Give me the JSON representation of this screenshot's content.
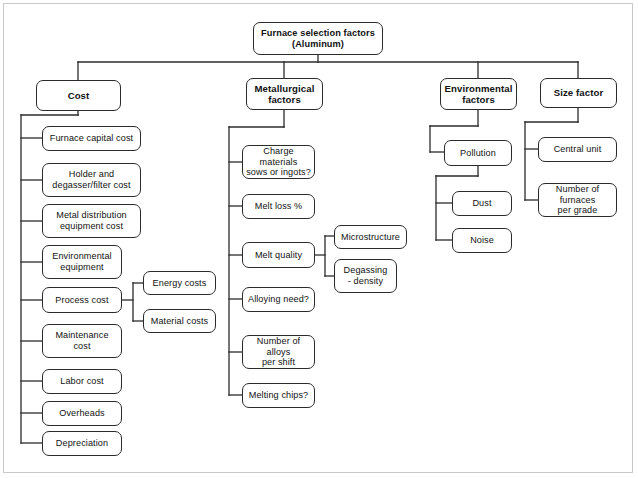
{
  "diagram": {
    "type": "tree-hierarchy",
    "title_node": {
      "id": "root",
      "label": "Furnace selection factors\n(Aluminum)"
    },
    "style": {
      "node_border_color": "#2b2b2b",
      "node_fill_color": "#ffffff",
      "edge_color": "#2b2b2b",
      "text_color": "#111111",
      "background_color": "#ffffff",
      "frame_color": "#c9c9c9"
    },
    "branches": [
      {
        "id": "cost",
        "label": "Cost",
        "children": [
          {
            "id": "furnace-capital-cost",
            "label": "Furnace capital cost"
          },
          {
            "id": "holder-degasser-filter-cost",
            "label": "Holder and\ndegasser/filter cost"
          },
          {
            "id": "metal-distribution-equipment-cost",
            "label": "Metal distribution\nequipment cost"
          },
          {
            "id": "environmental-equipment",
            "label": "Environmental\nequipment"
          },
          {
            "id": "process-cost",
            "label": "Process cost",
            "children": [
              {
                "id": "energy-costs",
                "label": "Energy costs"
              },
              {
                "id": "material-costs",
                "label": "Material costs"
              }
            ]
          },
          {
            "id": "maintenance-cost",
            "label": "Maintenance\ncost"
          },
          {
            "id": "labor-cost",
            "label": "Labor cost"
          },
          {
            "id": "overheads",
            "label": "Overheads"
          },
          {
            "id": "depreciation",
            "label": "Depreciation"
          }
        ]
      },
      {
        "id": "metallurgical-factors",
        "label": "Metallurgical\nfactors",
        "children": [
          {
            "id": "charge-materials",
            "label": "Charge materials\nsows or ingots?"
          },
          {
            "id": "melt-loss",
            "label": "Melt loss %"
          },
          {
            "id": "melt-quality",
            "label": "Melt quality",
            "children": [
              {
                "id": "microstructure",
                "label": "Microstructure"
              },
              {
                "id": "degassing-density",
                "label": "Degassing\n- density"
              }
            ]
          },
          {
            "id": "alloying-need",
            "label": "Alloying need?"
          },
          {
            "id": "number-of-alloys-per-shift",
            "label": "Number of alloys\nper shift"
          },
          {
            "id": "melting-chips",
            "label": "Melting chips?"
          }
        ]
      },
      {
        "id": "environmental-factors",
        "label": "Environmental\nfactors",
        "children": [
          {
            "id": "pollution",
            "label": "Pollution",
            "children": [
              {
                "id": "dust",
                "label": "Dust"
              },
              {
                "id": "noise",
                "label": "Noise"
              }
            ]
          }
        ]
      },
      {
        "id": "size-factor",
        "label": "Size factor",
        "children": [
          {
            "id": "central-unit",
            "label": "Central unit"
          },
          {
            "id": "number-of-furnaces-per-grade",
            "label": "Number of furnaces\nper grade"
          }
        ]
      }
    ]
  },
  "nodes": {
    "root": "Furnace selection factors\n(Aluminum)",
    "cost": "Cost",
    "metallurgical_factors": "Metallurgical\nfactors",
    "environmental_factors": "Environmental\nfactors",
    "size_factor": "Size factor",
    "furnace_capital_cost": "Furnace capital cost",
    "holder_degasser_filter_cost": "Holder and\ndegasser/filter cost",
    "metal_distribution_equipment_cost": "Metal distribution\nequipment cost",
    "environmental_equipment": "Environmental\nequipment",
    "process_cost": "Process cost",
    "energy_costs": "Energy costs",
    "material_costs": "Material costs",
    "maintenance_cost": "Maintenance\ncost",
    "labor_cost": "Labor cost",
    "overheads": "Overheads",
    "depreciation": "Depreciation",
    "charge_materials": "Charge materials\nsows or ingots?",
    "melt_loss": "Melt loss %",
    "melt_quality": "Melt quality",
    "microstructure": "Microstructure",
    "degassing_density": "Degassing\n- density",
    "alloying_need": "Alloying need?",
    "number_of_alloys_per_shift": "Number of alloys\nper shift",
    "melting_chips": "Melting chips?",
    "pollution": "Pollution",
    "dust": "Dust",
    "noise": "Noise",
    "central_unit": "Central unit",
    "number_of_furnaces_per_grade": "Number of furnaces\nper grade"
  }
}
